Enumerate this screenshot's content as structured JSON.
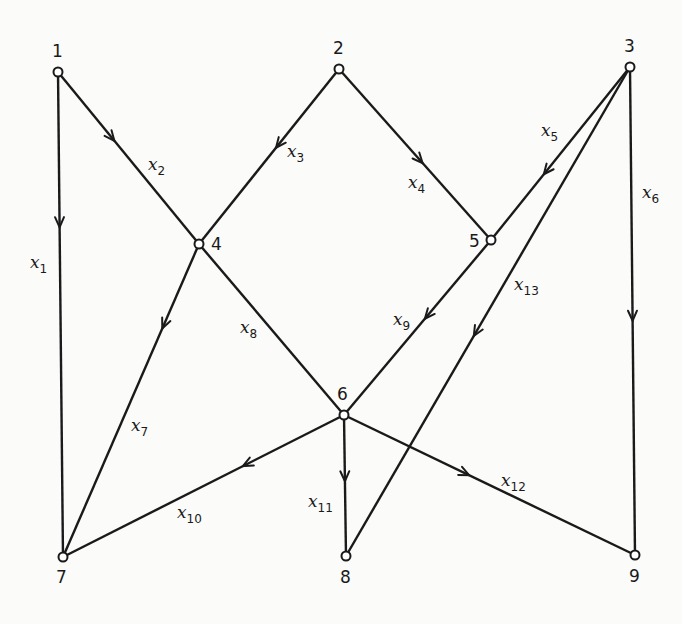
{
  "diagram": {
    "type": "directed-graph",
    "nodes": [
      {
        "id": "1",
        "label": "1",
        "x": 58,
        "y": 72,
        "lx": 52,
        "ly": 57
      },
      {
        "id": "2",
        "label": "2",
        "x": 339,
        "y": 69,
        "lx": 333,
        "ly": 54
      },
      {
        "id": "3",
        "label": "3",
        "x": 630,
        "y": 67,
        "lx": 624,
        "ly": 52
      },
      {
        "id": "4",
        "label": "4",
        "x": 199,
        "y": 244,
        "lx": 211,
        "ly": 250
      },
      {
        "id": "5",
        "label": "5",
        "x": 491,
        "y": 240,
        "lx": 469,
        "ly": 247
      },
      {
        "id": "6",
        "label": "6",
        "x": 344,
        "y": 415,
        "lx": 337,
        "ly": 400
      },
      {
        "id": "7",
        "label": "7",
        "x": 63,
        "y": 557,
        "lx": 56,
        "ly": 583
      },
      {
        "id": "8",
        "label": "8",
        "x": 346,
        "y": 556,
        "lx": 340,
        "ly": 583
      },
      {
        "id": "9",
        "label": "9",
        "x": 635,
        "y": 555,
        "lx": 629,
        "ly": 582
      }
    ],
    "edges": [
      {
        "id": "x1",
        "var": "x",
        "sub": "1",
        "from": "1",
        "to": "7",
        "arrow": 0.32,
        "lx": 30,
        "ly": 268
      },
      {
        "id": "x2",
        "var": "x",
        "sub": "2",
        "from": "1",
        "to": "4",
        "arrow": 0.4,
        "lx": 148,
        "ly": 170
      },
      {
        "id": "x3",
        "var": "x",
        "sub": "3",
        "from": "2",
        "to": "4",
        "arrow": 0.45,
        "lx": 287,
        "ly": 157
      },
      {
        "id": "x4",
        "var": "x",
        "sub": "4",
        "from": "2",
        "to": "5",
        "arrow": 0.55,
        "lx": 408,
        "ly": 188
      },
      {
        "id": "x5",
        "var": "x",
        "sub": "5",
        "from": "3",
        "to": "5",
        "arrow": 0.62,
        "lx": 541,
        "ly": 136
      },
      {
        "id": "x6",
        "var": "x",
        "sub": "6",
        "from": "3",
        "to": "9",
        "arrow": 0.52,
        "lx": 642,
        "ly": 198
      },
      {
        "id": "x7",
        "var": "x",
        "sub": "7",
        "from": "4",
        "to": "7",
        "arrow": 0.27,
        "lx": 131,
        "ly": 431
      },
      {
        "id": "x8",
        "var": "x",
        "sub": "8",
        "from": "4",
        "to": "6",
        "arrow": null,
        "lx": 240,
        "ly": 333
      },
      {
        "id": "x9",
        "var": "x",
        "sub": "9",
        "from": "5",
        "to": "6",
        "arrow": 0.45,
        "lx": 393,
        "ly": 325
      },
      {
        "id": "x10",
        "var": "x",
        "sub": "10",
        "from": "6",
        "to": "7",
        "arrow": 0.36,
        "lx": 177,
        "ly": 518
      },
      {
        "id": "x11",
        "var": "x",
        "sub": "11",
        "from": "6",
        "to": "8",
        "arrow": 0.47,
        "lx": 308,
        "ly": 507
      },
      {
        "id": "x12",
        "var": "x",
        "sub": "12",
        "from": "6",
        "to": "9",
        "arrow": 0.43,
        "lx": 501,
        "ly": 486
      },
      {
        "id": "x13",
        "var": "x",
        "sub": "13",
        "from": "3",
        "to": "8",
        "arrow": 0.55,
        "lx": 514,
        "ly": 290
      }
    ]
  }
}
